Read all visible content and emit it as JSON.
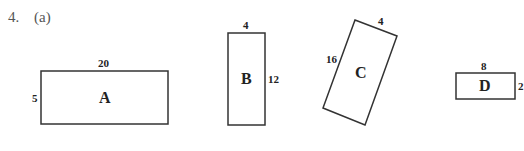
{
  "question": {
    "number": "4.",
    "part": "(a)"
  },
  "shapes": [
    {
      "name": "A",
      "width_label": "20",
      "height_label": "5"
    },
    {
      "name": "B",
      "width_label": "4",
      "height_label": "12"
    },
    {
      "name": "C",
      "width_label": "4",
      "height_label": "16"
    },
    {
      "name": "D",
      "width_label": "8",
      "height_label": "2"
    }
  ]
}
